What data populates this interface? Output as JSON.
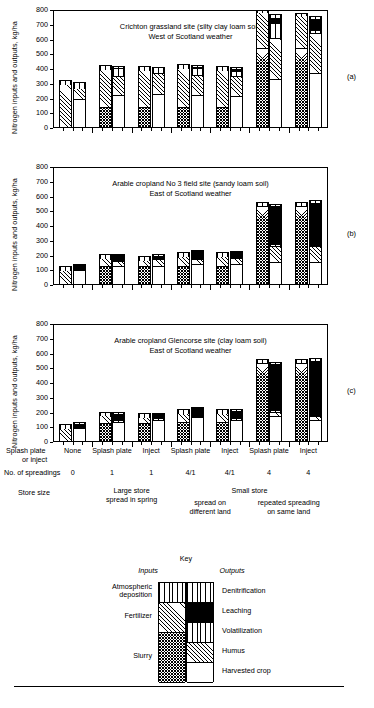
{
  "figure": {
    "ylabel": "Nitrogen inputs and outputs, kg/ha",
    "yticks": [
      "0",
      "100",
      "200",
      "300",
      "400",
      "500",
      "600",
      "700",
      "800"
    ],
    "ylim": [
      0,
      800
    ],
    "panel_labels": [
      "(a)",
      "(b)",
      "(c)"
    ]
  },
  "panels": [
    {
      "tag": "(a)",
      "title_line1": "Crichton grassland site (silty clay loam soil)",
      "title_line2": "West of Scotland weather"
    },
    {
      "tag": "(b)",
      "title_line1": "Arable cropland No 3 field site (sandy loam soil)",
      "title_line2": "East of Scotland weather"
    },
    {
      "tag": "(c)",
      "title_line1": "Arable cropland Glencorse site (clay loam soil)",
      "title_line2": "East of Scotland weather"
    }
  ],
  "axis_rows": {
    "row1_label_line1": "Splash plate",
    "row1_label_line2": "or inject",
    "row1_values": [
      "None",
      "Splash plate",
      "Inject",
      "Splash plate",
      "Inject",
      "Splash plate",
      "Inject"
    ],
    "row2_label": "No. of spreadings",
    "row2_values": [
      "0",
      "1",
      "1",
      "4/1",
      "4/1",
      "4",
      "4"
    ],
    "row3_label": "Store size",
    "row3_groups": [
      {
        "lines": [
          "Large store",
          "spread in spring"
        ]
      },
      {
        "lines": [
          "Small store"
        ]
      },
      {
        "lines": [
          "spread on",
          "different land"
        ]
      },
      {
        "lines": [
          "repeated spreading",
          "on same land"
        ]
      }
    ]
  },
  "key": {
    "title": "Key",
    "inputs_header": "Inputs",
    "outputs_header": "Outputs",
    "inputs": [
      {
        "label_line1": "Atmospheric",
        "label_line2": "deposition",
        "pattern": "p-vert"
      },
      {
        "label_line1": "Fertilizer",
        "label_line2": "",
        "pattern": "p-diag"
      },
      {
        "label_line1": "Slurry",
        "label_line2": "",
        "pattern": "p-check"
      }
    ],
    "outputs": [
      {
        "label": "Denitrification",
        "pattern": "p-vert"
      },
      {
        "label": "Leaching",
        "pattern": "p-black"
      },
      {
        "label": "Volatilization",
        "pattern": "p-vert"
      },
      {
        "label": "Humus",
        "pattern": "p-diag"
      },
      {
        "label": "Harvested crop",
        "pattern": "p-white"
      }
    ]
  },
  "chart_data": {
    "type": "bar",
    "ylabel": "Nitrogen inputs and outputs, kg/ha",
    "xlabel": "",
    "ylim": [
      0,
      800
    ],
    "ytick_step": 100,
    "grid": false,
    "legend_position": "below",
    "note": "Each treatment shows a paired INPUT bar (left) and OUTPUT bar (right). Values are kg N/ha; segment values are increments that stack bottom-to-top.",
    "categories": [
      "None / 0 spreadings",
      "Splash plate / 1 / Large store spread in spring",
      "Inject / 1 / Large store spread in spring",
      "Splash plate / 4-1 / Small store spread on different land",
      "Inject / 4-1 / Small store spread on different land",
      "Splash plate / 4 / Small store repeated spreading on same land",
      "Inject / 4 / Small store repeated spreading on same land"
    ],
    "input_segment_order_bottom_to_top": [
      "Slurry",
      "Fertilizer",
      "Atmospheric deposition"
    ],
    "output_segment_order_bottom_to_top": [
      "Harvested crop",
      "Humus",
      "Volatilization",
      "Leaching",
      "Denitrification"
    ],
    "panels": [
      {
        "panel": "(a)",
        "site": "Crichton grassland site (silty clay loam soil)",
        "weather": "West of Scotland weather",
        "inputs": [
          {
            "Slurry": 0,
            "Fertilizer": 300,
            "Atmospheric deposition": 25,
            "total": 325
          },
          {
            "Slurry": 140,
            "Fertilizer": 260,
            "Atmospheric deposition": 25,
            "total": 425
          },
          {
            "Slurry": 140,
            "Fertilizer": 255,
            "Atmospheric deposition": 25,
            "total": 420
          },
          {
            "Slurry": 140,
            "Fertilizer": 270,
            "Atmospheric deposition": 25,
            "total": 435
          },
          {
            "Slurry": 140,
            "Fertilizer": 255,
            "Atmospheric deposition": 25,
            "total": 420
          },
          {
            "Slurry": 540,
            "Fertilizer": 245,
            "Atmospheric deposition": 15,
            "total": 800
          },
          {
            "Slurry": 540,
            "Fertilizer": 225,
            "Atmospheric deposition": 15,
            "total": 780
          }
        ],
        "outputs": [
          {
            "Harvested crop": 195,
            "Humus": 75,
            "Volatilization": 45,
            "Leaching": 0,
            "Denitrification": 0,
            "total": 315
          },
          {
            "Harvested crop": 225,
            "Humus": 130,
            "Volatilization": 50,
            "Leaching": 10,
            "Denitrification": 5,
            "total": 420
          },
          {
            "Harvested crop": 230,
            "Humus": 140,
            "Volatilization": 35,
            "Leaching": 5,
            "Denitrification": 5,
            "total": 415
          },
          {
            "Harvested crop": 222,
            "Humus": 140,
            "Volatilization": 45,
            "Leaching": 15,
            "Denitrification": 8,
            "total": 430
          },
          {
            "Harvested crop": 215,
            "Humus": 140,
            "Volatilization": 30,
            "Leaching": 20,
            "Denitrification": 10,
            "total": 415
          },
          {
            "Harvested crop": 330,
            "Humus": 280,
            "Volatilization": 100,
            "Leaching": 40,
            "Denitrification": 20,
            "total": 770
          },
          {
            "Harvested crop": 375,
            "Humus": 270,
            "Volatilization": 20,
            "Leaching": 80,
            "Denitrification": 15,
            "total": 760
          }
        ]
      },
      {
        "panel": "(b)",
        "site": "Arable cropland No 3 field site (sandy loam soil)",
        "weather": "East of Scotland weather",
        "inputs": [
          {
            "Slurry": 0,
            "Fertilizer": 100,
            "Atmospheric deposition": 30,
            "total": 130
          },
          {
            "Slurry": 132,
            "Fertilizer": 50,
            "Atmospheric deposition": 28,
            "total": 210
          },
          {
            "Slurry": 132,
            "Fertilizer": 38,
            "Atmospheric deposition": 25,
            "total": 195
          },
          {
            "Slurry": 132,
            "Fertilizer": 62,
            "Atmospheric deposition": 30,
            "total": 224
          },
          {
            "Slurry": 132,
            "Fertilizer": 62,
            "Atmospheric deposition": 28,
            "total": 222
          },
          {
            "Slurry": 535,
            "Fertilizer": 5,
            "Atmospheric deposition": 20,
            "total": 560
          },
          {
            "Slurry": 535,
            "Fertilizer": 5,
            "Atmospheric deposition": 20,
            "total": 560
          }
        ],
        "outputs": [
          {
            "Harvested crop": 100,
            "Humus": 0,
            "Volatilization": 0,
            "Leaching": 40,
            "Denitrification": 0,
            "total": 140
          },
          {
            "Harvested crop": 128,
            "Humus": 35,
            "Volatilization": 5,
            "Leaching": 40,
            "Denitrification": 0,
            "total": 208
          },
          {
            "Harvested crop": 132,
            "Humus": 42,
            "Volatilization": 0,
            "Leaching": 32,
            "Denitrification": 5,
            "total": 211
          },
          {
            "Harvested crop": 140,
            "Humus": 38,
            "Volatilization": 5,
            "Leaching": 55,
            "Denitrification": 2,
            "total": 240
          },
          {
            "Harvested crop": 142,
            "Humus": 38,
            "Volatilization": 5,
            "Leaching": 45,
            "Denitrification": 2,
            "total": 232
          },
          {
            "Harvested crop": 155,
            "Humus": 110,
            "Volatilization": 15,
            "Leaching": 265,
            "Denitrification": 5,
            "total": 550
          },
          {
            "Harvested crop": 155,
            "Humus": 110,
            "Volatilization": 5,
            "Leaching": 295,
            "Denitrification": 10,
            "total": 575
          }
        ]
      },
      {
        "panel": "(c)",
        "site": "Arable cropland Glencorse site (clay loam soil)",
        "weather": "East of Scotland weather",
        "inputs": [
          {
            "Slurry": 0,
            "Fertilizer": 95,
            "Atmospheric deposition": 25,
            "total": 120
          },
          {
            "Slurry": 130,
            "Fertilizer": 50,
            "Atmospheric deposition": 25,
            "total": 205
          },
          {
            "Slurry": 130,
            "Fertilizer": 40,
            "Atmospheric deposition": 25,
            "total": 195
          },
          {
            "Slurry": 138,
            "Fertilizer": 58,
            "Atmospheric deposition": 28,
            "total": 224
          },
          {
            "Slurry": 138,
            "Fertilizer": 58,
            "Atmospheric deposition": 26,
            "total": 222
          },
          {
            "Slurry": 535,
            "Fertilizer": 5,
            "Atmospheric deposition": 20,
            "total": 560
          },
          {
            "Slurry": 535,
            "Fertilizer": 5,
            "Atmospheric deposition": 20,
            "total": 560
          }
        ],
        "outputs": [
          {
            "Harvested crop": 95,
            "Humus": 0,
            "Volatilization": 10,
            "Leaching": 25,
            "Denitrification": 5,
            "total": 135
          },
          {
            "Harvested crop": 138,
            "Humus": 0,
            "Volatilization": 10,
            "Leaching": 48,
            "Denitrification": 5,
            "total": 201
          },
          {
            "Harvested crop": 150,
            "Humus": 0,
            "Volatilization": 10,
            "Leaching": 35,
            "Denitrification": 5,
            "total": 200
          },
          {
            "Harvested crop": 168,
            "Humus": 0,
            "Volatilization": 8,
            "Leaching": 58,
            "Denitrification": 6,
            "total": 240
          },
          {
            "Harvested crop": 152,
            "Humus": 0,
            "Volatilization": 8,
            "Leaching": 60,
            "Denitrification": 5,
            "total": 225
          },
          {
            "Harvested crop": 175,
            "Humus": 30,
            "Volatilization": 10,
            "Leaching": 320,
            "Denitrification": 10,
            "total": 545
          },
          {
            "Harvested crop": 150,
            "Humus": 28,
            "Volatilization": 8,
            "Leaching": 370,
            "Denitrification": 14,
            "total": 570
          }
        ]
      }
    ]
  }
}
